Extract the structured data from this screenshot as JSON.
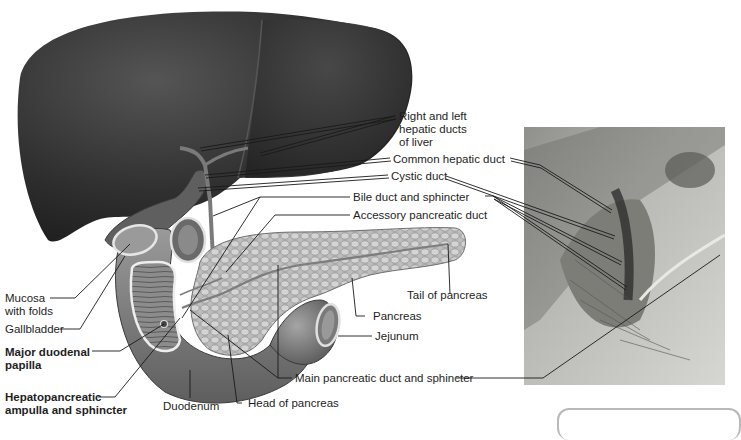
{
  "figure": {
    "type": "anatomical-diagram",
    "panels": [
      "illustration",
      "cadaver-photo"
    ]
  },
  "labels": {
    "right_left_hepatic_ducts": [
      "Right and left",
      "hepatic ducts",
      "of liver"
    ],
    "common_hepatic_duct": "Common hepatic duct",
    "cystic_duct": "Cystic duct",
    "bile_duct_sphincter": "Bile duct and sphincter",
    "accessory_pancreatic_duct": "Accessory pancreatic duct",
    "mucosa_with_folds": [
      "Mucosa",
      "with folds"
    ],
    "gallbladder": "Gallbladder",
    "major_duodenal_papilla": [
      "Major duodenal",
      "papilla"
    ],
    "hepatopancreatic_ampulla": [
      "Hepatopancreatic",
      "ampulla and sphincter"
    ],
    "duodenum": "Duodenum",
    "head_of_pancreas": "Head of pancreas",
    "tail_of_pancreas": "Tail of pancreas",
    "pancreas": "Pancreas",
    "jejunum": "Jejunum",
    "main_pancreatic_duct": "Main pancreatic duct and sphincter"
  },
  "colors": {
    "liver": "#2e2e2e",
    "pancreas": "#b8b8b8",
    "duodenum": "#8a8a8a",
    "leader_line": "#1a1a1a",
    "photo_bg": "#a9a9a5"
  }
}
